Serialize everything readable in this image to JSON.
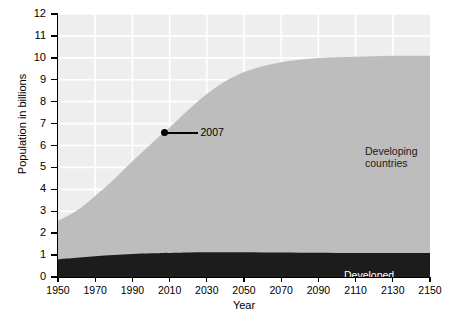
{
  "chart_data": {
    "type": "area",
    "title": "",
    "subtitle": "",
    "xlabel": "Year",
    "ylabel": "Population in billions",
    "xlim": [
      1950,
      2150
    ],
    "ylim": [
      0,
      12
    ],
    "grid": true,
    "stacked": true,
    "legend_position": "in-plot-annotations",
    "x_ticks": [
      1950,
      1970,
      1990,
      2010,
      2030,
      2050,
      2070,
      2090,
      2110,
      2130,
      2150
    ],
    "x_tick_labels": [
      "1950",
      "1970",
      "1990",
      "2010",
      "2030",
      "2050",
      "2070",
      "2090",
      "2110",
      "2130",
      "2150"
    ],
    "y_ticks": [
      0,
      1,
      2,
      3,
      4,
      5,
      6,
      7,
      8,
      9,
      10,
      11,
      12
    ],
    "y_tick_labels": [
      "0",
      "1",
      "2",
      "3",
      "4",
      "5",
      "6",
      "7",
      "8",
      "9",
      "10",
      "11",
      "12"
    ],
    "x": [
      1950,
      1960,
      1970,
      1980,
      1990,
      2000,
      2007,
      2010,
      2020,
      2030,
      2040,
      2050,
      2060,
      2070,
      2080,
      2090,
      2100,
      2110,
      2120,
      2130,
      2140,
      2150
    ],
    "series": [
      {
        "name": "Developed countries",
        "color": "#1c1c1c",
        "label": "Developed countries",
        "values": [
          0.81,
          0.88,
          0.95,
          1.0,
          1.05,
          1.08,
          1.1,
          1.1,
          1.12,
          1.13,
          1.13,
          1.13,
          1.12,
          1.12,
          1.11,
          1.11,
          1.1,
          1.1,
          1.1,
          1.1,
          1.1,
          1.1
        ]
      },
      {
        "name": "Developing countries",
        "color": "#bdbdbd",
        "label": "Developing\ncountries",
        "values": [
          1.75,
          2.14,
          2.75,
          3.45,
          4.23,
          4.99,
          5.5,
          5.72,
          6.5,
          7.22,
          7.8,
          8.22,
          8.5,
          8.68,
          8.8,
          8.88,
          8.93,
          8.95,
          8.97,
          8.99,
          9.0,
          9.0
        ]
      }
    ],
    "totals": [
      2.56,
      3.02,
      3.7,
      4.45,
      5.28,
      6.07,
      6.6,
      6.82,
      7.62,
      8.35,
      8.93,
      9.35,
      9.62,
      9.8,
      9.91,
      9.99,
      10.03,
      10.05,
      10.07,
      10.09,
      10.1,
      10.1
    ],
    "annotations": [
      {
        "name": "2007-marker",
        "label": "2007",
        "x": 2007,
        "y": 6.6,
        "marker": "filled-circle",
        "leader_line": true
      }
    ],
    "background_color": "#eeeeee",
    "gridline_color": "#ffffff",
    "axis_color": "#000000"
  }
}
